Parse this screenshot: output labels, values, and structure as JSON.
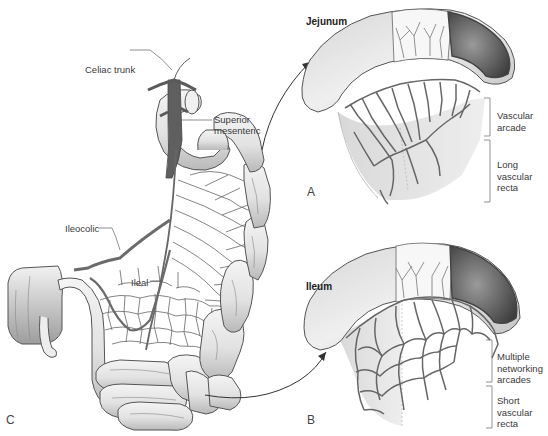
{
  "figure": {
    "panels": {
      "A": {
        "letter": "A",
        "title": "Jejunum",
        "brackets": [
          {
            "label": "Vascular\narcade"
          },
          {
            "label": "Long\nvascular\nrecta"
          }
        ]
      },
      "B": {
        "letter": "B",
        "title": "Ileum",
        "brackets": [
          {
            "label": "Multiple\nnetworking\narcades"
          },
          {
            "label": "Short\nvascular\nrecta"
          }
        ]
      },
      "C": {
        "letter": "C"
      }
    },
    "labels": {
      "celiac_trunk": "Celiac trunk",
      "superior_mesenteric_1": "Superior",
      "superior_mesenteric_2": "mesenteric",
      "ileocolic": "Ileocolic",
      "ileal": "Ileal"
    },
    "colors": {
      "vessel": "#6b6b6b",
      "bowel_fill": "#e6e6e6",
      "bowel_shade": "#bdbdbd",
      "outline": "#555555",
      "lumen_dark": "#4a4a4a"
    }
  }
}
